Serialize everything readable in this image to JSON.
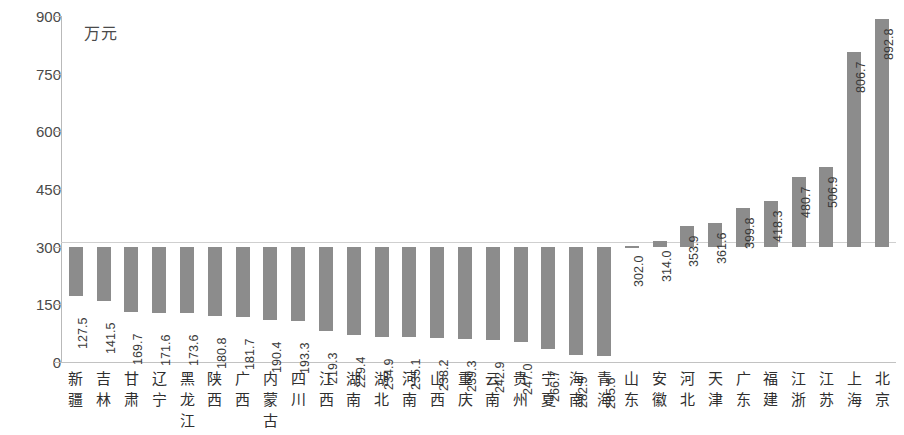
{
  "chart_data": {
    "type": "bar",
    "title": "",
    "subtitle": "",
    "xlabel": "",
    "ylabel": "",
    "unit_label": "万元",
    "ylim": [
      0,
      900
    ],
    "yticks": [
      900,
      750,
      600,
      450,
      300,
      150,
      0
    ],
    "grid": false,
    "legend": null,
    "bar_color": "#8c8c8c",
    "axis_color": "#b9b9b9",
    "baseline_reference": 300,
    "categories": [
      "新疆",
      "吉林",
      "甘肃",
      "辽宁",
      "黑龙江",
      "陕西",
      "广西",
      "内蒙古",
      "四川",
      "江西",
      "湖南",
      "湖北",
      "河南",
      "山西",
      "重庆",
      "云南",
      "贵州",
      "宁夏",
      "海南",
      "青海",
      "山东",
      "安徽",
      "河北",
      "天津",
      "广东",
      "福建",
      "江浙",
      "江苏",
      "上海",
      "北京"
    ],
    "values": [
      127.5,
      141.5,
      169.7,
      171.6,
      173.6,
      180.8,
      181.7,
      190.4,
      193.3,
      219.3,
      229.4,
      234.9,
      235.1,
      238.2,
      239.3,
      242.9,
      247.0,
      266.7,
      282.5,
      285.6,
      302.0,
      314.0,
      353.9,
      361.6,
      399.8,
      418.3,
      480.7,
      506.9,
      806.7,
      892.8
    ],
    "value_labels": [
      "127.5",
      "141.5",
      "169.7",
      "171.6",
      "173.6",
      "180.8",
      "181.7",
      "190.4",
      "193.3",
      "219.3",
      "229.4",
      "234.9",
      "235.1",
      "238.2",
      "239.3",
      "242.9",
      "247.0",
      "266.7",
      "282.5",
      "285.6",
      "302.0",
      "314.0",
      "353.9",
      "361.6",
      "399.8",
      "418.3",
      "480.7",
      "506.9",
      "806.7",
      "892.8"
    ],
    "ytick_labels": [
      "900",
      "750",
      "600",
      "450",
      "300",
      "150",
      "0"
    ]
  }
}
